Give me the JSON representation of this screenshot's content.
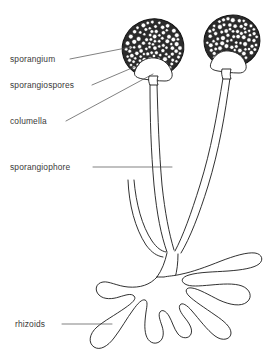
{
  "figure": {
    "organism": "bread mold",
    "style": "black and white line drawing",
    "background_color": "#ffffff",
    "line_color": "#1a1a1a",
    "label_color": "#3a3a3a"
  },
  "labels": [
    {
      "id": "sporangium",
      "text": "sporangium",
      "x": 10,
      "y": 62,
      "leader_from": [
        70,
        59
      ],
      "leader_to": [
        131,
        47
      ]
    },
    {
      "id": "sporangiospores",
      "text": "sporangiospores",
      "x": 10,
      "y": 88,
      "leader_from": [
        92,
        85
      ],
      "leader_to": [
        139,
        65
      ]
    },
    {
      "id": "columella",
      "text": "columella",
      "x": 10,
      "y": 124,
      "leader_from": [
        66,
        121
      ],
      "leader_to": [
        153,
        74
      ]
    },
    {
      "id": "sporangiophore",
      "text": "sporangiophore",
      "x": 10,
      "y": 170,
      "leader_from": [
        93,
        167
      ],
      "leader_to": [
        172,
        167
      ]
    },
    {
      "id": "rhizoids",
      "text": "rhizoids",
      "x": 15,
      "y": 327,
      "leader_from": [
        62,
        324
      ],
      "leader_to": [
        112,
        324
      ]
    }
  ],
  "structures": {
    "sporangium_left": {
      "name": "left sporangium",
      "center_x": 153,
      "center_y": 48,
      "radius_x": 31,
      "radius_y": 29,
      "rotation": -18,
      "spore_count": 150
    },
    "sporangium_right": {
      "name": "right sporangium",
      "center_x": 232,
      "center_y": 41,
      "radius_x": 28,
      "radius_y": 26,
      "rotation": -10,
      "spore_count": 120
    },
    "columella_left": {
      "name": "left columella",
      "x": 152,
      "y": 72
    },
    "columella_right": {
      "name": "right columella",
      "x": 228,
      "y": 64
    },
    "sporangiophores": [
      {
        "name": "left sporangiophore stalk"
      },
      {
        "name": "right sporangiophore stalk"
      },
      {
        "name": "short sporangiophore stalk"
      }
    ],
    "rhizoid_system": {
      "name": "rhizoid branching mass",
      "lobe_count": 8
    }
  }
}
